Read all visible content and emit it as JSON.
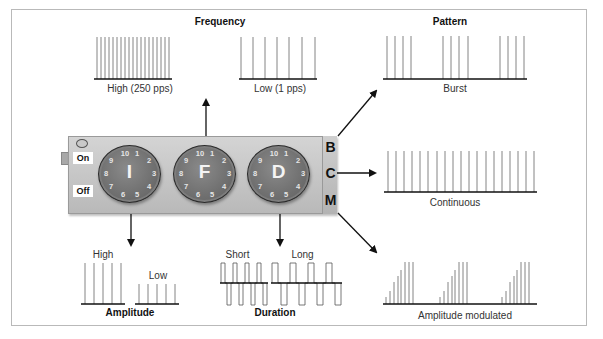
{
  "frequency": {
    "title": "Frequency",
    "high_label": "High (250 pps)",
    "low_label": "Low (1 pps)"
  },
  "pattern": {
    "title": "Pattern",
    "burst_label": "Burst",
    "continuous_label": "Continuous",
    "modulated_label": "Amplitude modulated"
  },
  "amplitude": {
    "title": "Amplitude",
    "high_label": "High",
    "low_label": "Low"
  },
  "duration": {
    "title": "Duration",
    "short_label": "Short",
    "long_label": "Long"
  },
  "device": {
    "switch_on": "On",
    "switch_off": "Off",
    "dials": [
      {
        "letter": "I",
        "numbers": [
          "10",
          "1",
          "2",
          "3",
          "4",
          "5",
          "6",
          "7",
          "8",
          "9"
        ]
      },
      {
        "letter": "F",
        "numbers": [
          "10",
          "1",
          "2",
          "3",
          "4",
          "5",
          "6",
          "7",
          "8",
          "9"
        ]
      },
      {
        "letter": "D",
        "numbers": [
          "10",
          "1",
          "2",
          "3",
          "4",
          "5",
          "6",
          "7",
          "8",
          "9"
        ]
      }
    ],
    "modes": [
      "B",
      "C",
      "M"
    ]
  },
  "colors": {
    "panel": "#c6c6c6",
    "dial": "#777777",
    "line": "#111111",
    "pulse": "#555555",
    "frame": "#b9b9b9"
  }
}
